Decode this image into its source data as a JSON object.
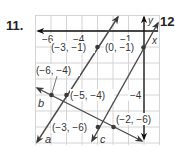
{
  "problem": {
    "number": "11.",
    "next_number": "12"
  },
  "graph": {
    "axis_labels": {
      "x": "x",
      "y": "y"
    },
    "x_ticks": [
      {
        "label": "−6",
        "value": -6
      },
      {
        "label": "−4",
        "value": -4
      },
      {
        "label": "−1",
        "value": -1
      }
    ],
    "y_ticks": [
      {
        "label": "−4",
        "value": -4
      }
    ],
    "points": [
      {
        "label": "(−3, −1)",
        "x": -3,
        "y": -1
      },
      {
        "label": "(0, −1)",
        "x": 0,
        "y": -1
      },
      {
        "label": "(−6, −4)",
        "x": -6,
        "y": -4
      },
      {
        "label": "(−5, −4)",
        "x": -5,
        "y": -4
      },
      {
        "label": "(−3, −6)",
        "x": -3,
        "y": -6
      },
      {
        "label": "(−2, −6)",
        "x": -2,
        "y": -6
      }
    ],
    "lines": [
      {
        "name": "a",
        "through": [
          "(-5,-4)",
          "(-3,-1)"
        ]
      },
      {
        "name": "b",
        "through": [
          "(-6,-4)",
          "(-2,-6)"
        ]
      },
      {
        "name": "c",
        "through": [
          "(-3,-6)",
          "(0,-1)"
        ]
      }
    ],
    "colors": {
      "grid": "#d4d4d4",
      "axis": "#1a1a1a",
      "line": "#4a4a4a",
      "text": "#333333"
    }
  }
}
